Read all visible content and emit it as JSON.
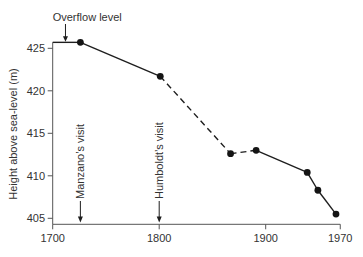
{
  "chart_data": {
    "type": "line",
    "title": "",
    "xlabel": "",
    "ylabel": "Height above sea-level (m)",
    "xlim": [
      1700,
      1970
    ],
    "ylim": [
      405,
      425.7
    ],
    "x_ticks": [
      1700,
      1800,
      1900,
      1970
    ],
    "x_tick_labels": [
      "1700",
      "1800",
      "1900",
      "1970"
    ],
    "y_ticks": [
      405,
      410,
      415,
      420,
      425
    ],
    "y_tick_labels": [
      "405",
      "410",
      "415",
      "420",
      "425"
    ],
    "grid": false,
    "legend": null,
    "series": [
      {
        "name": "Lake level",
        "x": [
          1726,
          1801,
          1867,
          1891,
          1939,
          1949,
          1966
        ],
        "values": [
          425.7,
          421.7,
          412.6,
          413.0,
          410.4,
          408.3,
          405.5
        ],
        "segment_styles": [
          "solid",
          "dashed",
          "dashed",
          "solid",
          "solid",
          "solid"
        ],
        "markers": true
      }
    ],
    "annotations": [
      {
        "type": "level-line",
        "text": "Overflow level",
        "y": 425.7,
        "x_start": 1700,
        "x_end": 1726,
        "arrow_x": 1712
      },
      {
        "type": "vertical-arrow",
        "text": "Manzano’s visit",
        "x": 1726
      },
      {
        "type": "vertical-arrow",
        "text": "Humboldt’s visit",
        "x": 1800
      }
    ],
    "colors": {
      "line": "#1e1e1e",
      "marker": "#141414",
      "axis": "#555555",
      "text": "#333333"
    }
  }
}
